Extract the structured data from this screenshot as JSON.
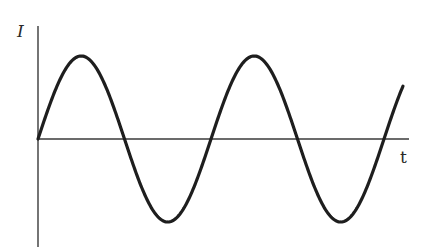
{
  "diagram": {
    "y_axis_label": "I",
    "x_axis_label": "t"
  },
  "chart_data": {
    "type": "line",
    "title": "",
    "xlabel": "t",
    "ylabel": "I",
    "function": "I = I0 * sin(2*pi*t/T)",
    "periods_shown": 2.1,
    "x_axis_pixels": {
      "start": 38,
      "end": 409,
      "y": 139
    },
    "y_axis_pixels": {
      "x": 38,
      "top": 26,
      "bottom": 247
    },
    "curve_pixels": {
      "start_x": 38,
      "end_x": 403,
      "period_px": 173,
      "amplitude_px": 83,
      "zero_crossings_x": [
        38,
        124,
        211,
        385
      ],
      "peaks": [
        {
          "x": 81,
          "y": 56
        },
        {
          "x": 254,
          "y": 56
        }
      ],
      "troughs": [
        {
          "x": 168,
          "y": 222
        },
        {
          "x": 341,
          "y": 222
        }
      ]
    },
    "colors": {
      "curve": "#1e1e1e",
      "axes": "#3a3a3a",
      "background": "#ffffff"
    },
    "grid": false,
    "legend": null
  }
}
